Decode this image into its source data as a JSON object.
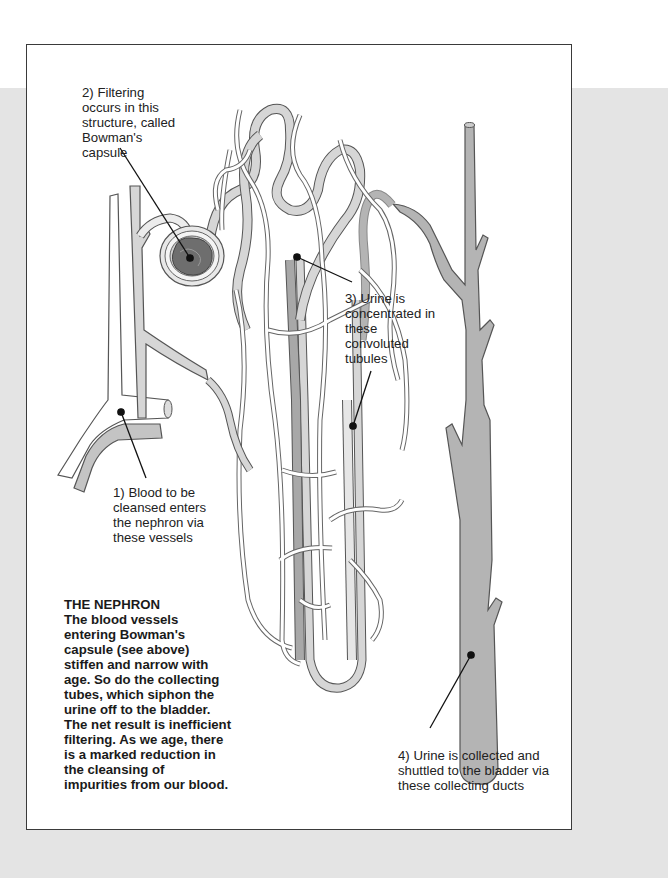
{
  "diagram": {
    "title": "THE NEPHRON",
    "labels": {
      "label_1": "1) Blood to be\ncleansed enters\nthe nephron via\nthese vessels",
      "label_2": "2) Filtering\noccurs in this\nstructure, called\nBowman's\ncapsule",
      "label_3": "3) Urine is\nconcentrated in\nthese\nconvoluted\ntubules",
      "label_4": "4) Urine is collected and\nshuttled to the bladder via\nthese collecting ducts"
    },
    "structures": [
      "blood-vessels",
      "bowmans-capsule",
      "convoluted-tubules",
      "loop-of-henle",
      "collecting-duct"
    ],
    "colors": {
      "background_band": "#e4e4e4",
      "frame_border": "#3a3a3a",
      "vessel_fill": "#d6d6d6",
      "duct_fill": "#b4b4b4",
      "glomerulus": "#6e6e6e",
      "outline": "#555555"
    }
  }
}
